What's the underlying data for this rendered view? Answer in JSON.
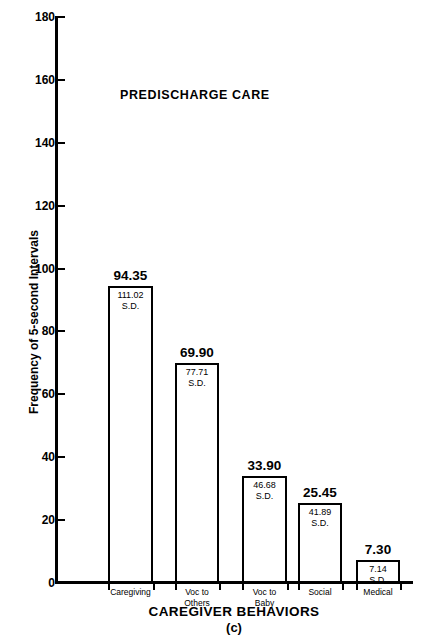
{
  "chart_data": {
    "type": "bar",
    "title": "PREDISCHARGE CARE",
    "xlabel": "CAREGIVER BEHAVIORS",
    "ylabel": "Frequency of 5-second Intervals",
    "caption": "(c)",
    "ylim": [
      0,
      180
    ],
    "ytick_step": 20,
    "yticks": [
      {
        "value": 180,
        "label": "180"
      },
      {
        "value": 160,
        "label": "160"
      },
      {
        "value": 140,
        "label": "140"
      },
      {
        "value": 120,
        "label": "120"
      },
      {
        "value": 100,
        "label": "100"
      },
      {
        "value": 80,
        "label": "80"
      },
      {
        "value": 60,
        "label": "60"
      },
      {
        "value": 40,
        "label": "40"
      },
      {
        "value": 20,
        "label": "20"
      },
      {
        "value": 0,
        "label": "0"
      }
    ],
    "grid": false,
    "legend": "none",
    "sd_tag": "S.D.",
    "categories": [
      "Caregiving",
      "Voc to Others",
      "Voc to Baby",
      "Social",
      "Medical"
    ],
    "values": [
      94.35,
      69.9,
      33.9,
      25.45,
      7.3
    ],
    "sd": [
      111.02,
      77.71,
      46.68,
      41.89,
      7.14
    ],
    "bars": [
      {
        "category_lines": [
          "Caregiving"
        ],
        "value": 94.35,
        "value_label": "94.35",
        "sd": 111.02,
        "sd_label": "111.02",
        "sd_tag": "S.D."
      },
      {
        "category_lines": [
          "Voc to",
          "Others"
        ],
        "value": 69.9,
        "value_label": "69.90",
        "sd": 77.71,
        "sd_label": "77.71",
        "sd_tag": "S.D."
      },
      {
        "category_lines": [
          "Voc to",
          "Baby"
        ],
        "value": 33.9,
        "value_label": "33.90",
        "sd": 46.68,
        "sd_label": "46.68",
        "sd_tag": "S.D."
      },
      {
        "category_lines": [
          "Social"
        ],
        "value": 25.45,
        "value_label": "25.45",
        "sd": 41.89,
        "sd_label": "41.89",
        "sd_tag": "S.D."
      },
      {
        "category_lines": [
          "Medical"
        ],
        "value": 7.3,
        "value_label": "7.30",
        "sd": 7.14,
        "sd_label": "7.14",
        "sd_tag": "S.D."
      }
    ],
    "colors": {
      "axis": "#000000",
      "bar_stroke": "#000000",
      "bar_fill": "#ffffff",
      "text": "#000000",
      "background": "#ffffff"
    }
  }
}
